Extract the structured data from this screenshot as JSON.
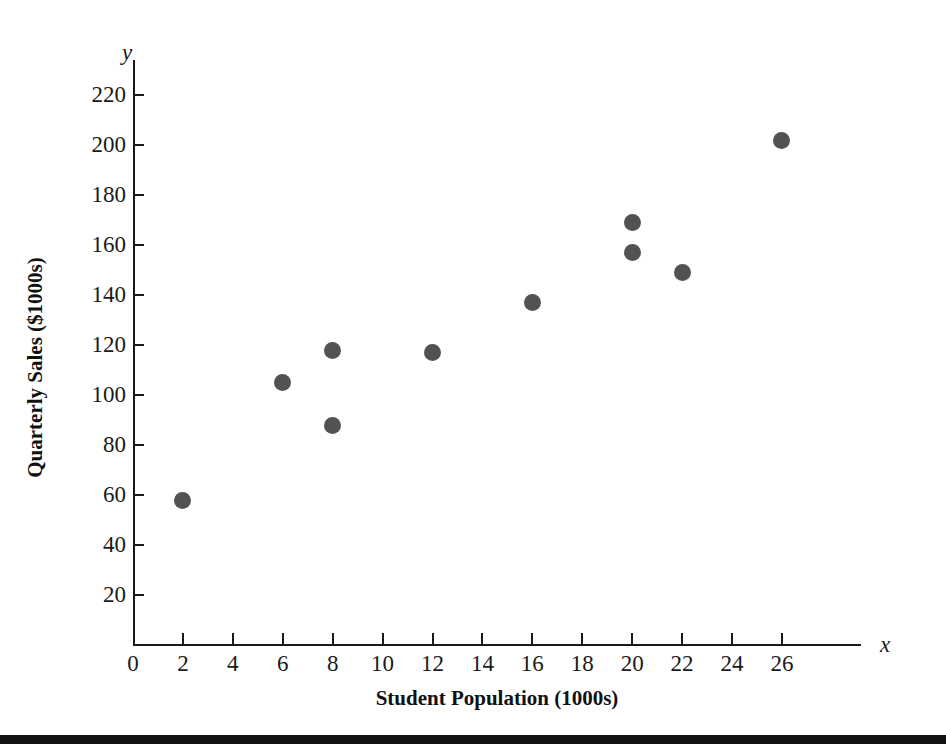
{
  "chart_data": {
    "type": "scatter",
    "title": "",
    "xlabel": "Student Population (1000s)",
    "ylabel": "Quarterly Sales ($1000s)",
    "x_axis_symbol": "x",
    "y_axis_symbol": "y",
    "xlim": [
      0,
      29
    ],
    "ylim": [
      0,
      232
    ],
    "grid": false,
    "legend": null,
    "marker_color": "#525252",
    "axis_color": "#1a1a1a",
    "xticks": [
      0,
      2,
      4,
      6,
      8,
      10,
      12,
      14,
      16,
      18,
      20,
      22,
      24,
      26
    ],
    "yticks": [
      20,
      40,
      60,
      80,
      100,
      120,
      140,
      160,
      180,
      200,
      220
    ],
    "x": [
      2,
      6,
      8,
      8,
      12,
      16,
      20,
      20,
      22,
      26
    ],
    "y": [
      58,
      105,
      88,
      118,
      117,
      137,
      157,
      169,
      149,
      202
    ],
    "points": [
      {
        "x": 2,
        "y": 58
      },
      {
        "x": 6,
        "y": 105
      },
      {
        "x": 8,
        "y": 88
      },
      {
        "x": 8,
        "y": 118
      },
      {
        "x": 12,
        "y": 117
      },
      {
        "x": 16,
        "y": 137
      },
      {
        "x": 20,
        "y": 157
      },
      {
        "x": 20,
        "y": 169
      },
      {
        "x": 22,
        "y": 149
      },
      {
        "x": 26,
        "y": 202
      }
    ]
  }
}
